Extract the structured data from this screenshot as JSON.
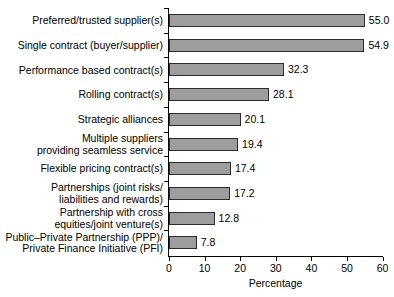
{
  "chart_data": {
    "type": "bar",
    "orientation": "horizontal",
    "title": "",
    "xlabel": "Percentage",
    "ylabel": "",
    "xlim": [
      0,
      60
    ],
    "xticks": [
      0,
      10,
      20,
      30,
      40,
      50,
      60
    ],
    "xtick_labels": [
      "0",
      "10",
      "20",
      "30",
      "40",
      "50",
      "60"
    ],
    "grid": false,
    "legend": null,
    "bar_color": "#9d9d9d",
    "bar_edge_color": "#2b2b2b",
    "categories": [
      "Preferred/trusted supplier(s)",
      "Single contract (buyer/supplier)",
      "Performance based contract(s)",
      "Rolling contract(s)",
      "Strategic alliances",
      "Multiple suppliers\nproviding seamless service",
      "Flexible pricing contract(s)",
      "Partnerships (joint risks/\nliabilities and rewards)",
      "Partnership with cross\nequities/joint venture(s)",
      "Public–Private Partnership (PPP)/\nPrivate Finance Initiative (PFI)"
    ],
    "values": [
      55.0,
      54.9,
      32.3,
      28.1,
      20.1,
      19.4,
      17.4,
      17.2,
      12.8,
      7.8
    ],
    "value_labels": [
      "55.0",
      "54.9",
      "32.3",
      "28.1",
      "20.1",
      "19.4",
      "17.4",
      "17.2",
      "12.8",
      "7.8"
    ]
  }
}
